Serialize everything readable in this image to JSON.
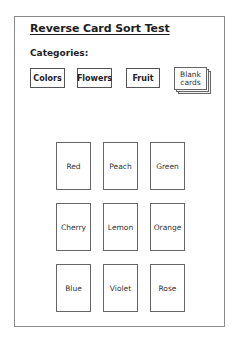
{
  "title": "Reverse Card Sort Test",
  "categories_label": "Categories:",
  "categories": [
    {
      "label": "Colors"
    },
    {
      "label": "Flowers"
    },
    {
      "label": "Fruit"
    }
  ],
  "blank_cards": {
    "line1": "Blank",
    "line2": "cards"
  },
  "cards": [
    {
      "label": "Red"
    },
    {
      "label": "Peach"
    },
    {
      "label": "Green"
    },
    {
      "label": "Cherry"
    },
    {
      "label": "Lemon"
    },
    {
      "label": "Orange"
    },
    {
      "label": "Blue"
    },
    {
      "label": "Violet"
    },
    {
      "label": "Rose"
    }
  ],
  "colors": {
    "border": "#666666",
    "frame": "#8a8a8a",
    "text": "#222222",
    "background": "#ffffff"
  }
}
